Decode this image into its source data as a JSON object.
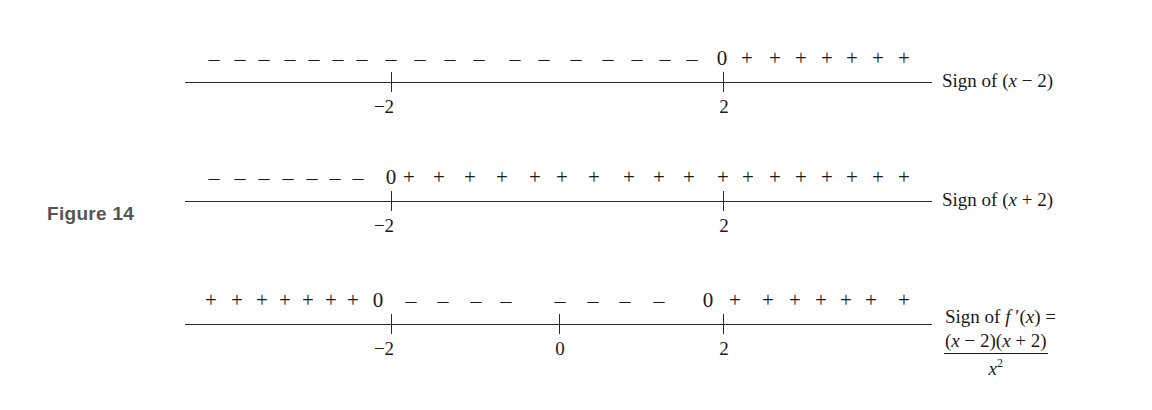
{
  "figure": {
    "label": "Figure 14",
    "label_color": "#555555"
  },
  "rows": [
    {
      "name": "sign-of-x-minus-2",
      "label": "Sign of (x − 2)",
      "label_parts": [
        "Sign of (",
        "x",
        " − 2)"
      ],
      "ticks": [
        {
          "value": "−2",
          "x": 392
        },
        {
          "value": "2",
          "x": 724
        }
      ],
      "signs": [
        {
          "s": "–",
          "x": 214
        },
        {
          "s": "–",
          "x": 240
        },
        {
          "s": "–",
          "x": 264
        },
        {
          "s": "–",
          "x": 290
        },
        {
          "s": "–",
          "x": 314
        },
        {
          "s": "–",
          "x": 338
        },
        {
          "s": "–",
          "x": 362
        },
        {
          "s": "–",
          "x": 391
        },
        {
          "s": "–",
          "x": 420
        },
        {
          "s": "–",
          "x": 450
        },
        {
          "s": "–",
          "x": 479
        },
        {
          "s": "–",
          "x": 515
        },
        {
          "s": "–",
          "x": 544
        },
        {
          "s": "–",
          "x": 576
        },
        {
          "s": "–",
          "x": 608
        },
        {
          "s": "–",
          "x": 637
        },
        {
          "s": "–",
          "x": 665
        },
        {
          "s": "–",
          "x": 692
        },
        {
          "s": "0",
          "x": 722
        },
        {
          "s": "+",
          "x": 747
        },
        {
          "s": "+",
          "x": 775
        },
        {
          "s": "+",
          "x": 801
        },
        {
          "s": "+",
          "x": 827
        },
        {
          "s": "+",
          "x": 852
        },
        {
          "s": "+",
          "x": 878
        },
        {
          "s": "+",
          "x": 904
        }
      ]
    },
    {
      "name": "sign-of-x-plus-2",
      "label": "Sign of (x + 2)",
      "label_parts": [
        "Sign of (",
        "x",
        " + 2)"
      ],
      "ticks": [
        {
          "value": "−2",
          "x": 392
        },
        {
          "value": "2",
          "x": 724
        }
      ],
      "signs": [
        {
          "s": "–",
          "x": 214
        },
        {
          "s": "–",
          "x": 240
        },
        {
          "s": "–",
          "x": 264
        },
        {
          "s": "–",
          "x": 288
        },
        {
          "s": "–",
          "x": 312
        },
        {
          "s": "–",
          "x": 335
        },
        {
          "s": "–",
          "x": 358
        },
        {
          "s": "0",
          "x": 391
        },
        {
          "s": "+",
          "x": 409
        },
        {
          "s": "+",
          "x": 439
        },
        {
          "s": "+",
          "x": 470
        },
        {
          "s": "+",
          "x": 502
        },
        {
          "s": "+",
          "x": 535
        },
        {
          "s": "+",
          "x": 562
        },
        {
          "s": "+",
          "x": 594
        },
        {
          "s": "+",
          "x": 629
        },
        {
          "s": "+",
          "x": 659
        },
        {
          "s": "+",
          "x": 689
        },
        {
          "s": "+",
          "x": 723
        },
        {
          "s": "+",
          "x": 748
        },
        {
          "s": "+",
          "x": 775
        },
        {
          "s": "+",
          "x": 801
        },
        {
          "s": "+",
          "x": 827
        },
        {
          "s": "+",
          "x": 852
        },
        {
          "s": "+",
          "x": 878
        },
        {
          "s": "+",
          "x": 904
        }
      ]
    },
    {
      "name": "sign-of-f-prime",
      "label": "Sign of f ′(x) =",
      "label_parts": [
        "Sign of ",
        "f",
        " ′(",
        "x",
        ") ="
      ],
      "fraction": {
        "numerator_parts": [
          "(",
          "x",
          " − 2)(",
          "x",
          " + 2)"
        ],
        "denominator_base": "x",
        "denominator_exp": "2"
      },
      "ticks": [
        {
          "value": "−2",
          "x": 392
        },
        {
          "value": "0",
          "x": 560
        },
        {
          "value": "2",
          "x": 724
        }
      ],
      "signs": [
        {
          "s": "+",
          "x": 211
        },
        {
          "s": "+",
          "x": 237
        },
        {
          "s": "+",
          "x": 262
        },
        {
          "s": "+",
          "x": 285
        },
        {
          "s": "+",
          "x": 308
        },
        {
          "s": "+",
          "x": 331
        },
        {
          "s": "+",
          "x": 353
        },
        {
          "s": "0",
          "x": 378
        },
        {
          "s": "–",
          "x": 411
        },
        {
          "s": "–",
          "x": 443
        },
        {
          "s": "–",
          "x": 476
        },
        {
          "s": "–",
          "x": 506
        },
        {
          "s": "–",
          "x": 560
        },
        {
          "s": "–",
          "x": 593
        },
        {
          "s": "–",
          "x": 625
        },
        {
          "s": "–",
          "x": 659
        },
        {
          "s": "0",
          "x": 708
        },
        {
          "s": "+",
          "x": 735
        },
        {
          "s": "+",
          "x": 768
        },
        {
          "s": "+",
          "x": 795
        },
        {
          "s": "+",
          "x": 821
        },
        {
          "s": "+",
          "x": 846
        },
        {
          "s": "+",
          "x": 871
        },
        {
          "s": "+",
          "x": 904
        }
      ]
    }
  ]
}
